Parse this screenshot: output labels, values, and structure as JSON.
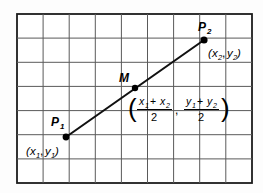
{
  "figure": {
    "type": "geometry-diagram",
    "background_color": "#fdfdfd",
    "frame": {
      "x": 17,
      "y": 14,
      "width": 235,
      "height": 169,
      "fill": "#ffffff",
      "stroke": "#1c1c1c"
    },
    "grid": {
      "columns": 9,
      "rows": 7,
      "line_color": "#5a5a5a",
      "cell_width": 26.1,
      "cell_height": 24.1
    },
    "segment": {
      "color": "#111111",
      "from": {
        "x": 66,
        "y": 137
      },
      "to": {
        "x": 204,
        "y": 40
      }
    },
    "points": [
      {
        "id": "p1",
        "label": "P",
        "label_subscript": "1",
        "coord_open": "(",
        "coord_x": "x",
        "coord_x_sub": "1",
        "coord_comma": ",",
        "coord_y": "y",
        "coord_y_sub": "1",
        "coord_close": ")",
        "cx": 66,
        "cy": 137
      },
      {
        "id": "p2",
        "label": "P",
        "label_subscript": "2",
        "coord_open": "(",
        "coord_x": "x",
        "coord_x_sub": "2",
        "coord_comma": ",",
        "coord_y": "y",
        "coord_y_sub": "2",
        "coord_close": ")",
        "cx": 204,
        "cy": 40
      },
      {
        "id": "midpoint",
        "label": "M",
        "label_subscript": "",
        "cx": 135,
        "cy": 88
      }
    ],
    "midpoint_formula": {
      "open_paren": "(",
      "close_paren": ")",
      "separator": ",",
      "x_fraction": {
        "numerator_term1": "x",
        "numerator_term1_sub": "1",
        "numerator_operator": "+",
        "numerator_term2": "x",
        "numerator_term2_sub": "2",
        "denominator": "2"
      },
      "y_fraction": {
        "numerator_term1": "y",
        "numerator_term1_sub": "1",
        "numerator_operator": "+",
        "numerator_term2": "y",
        "numerator_term2_sub": "2",
        "denominator": "2"
      }
    }
  }
}
